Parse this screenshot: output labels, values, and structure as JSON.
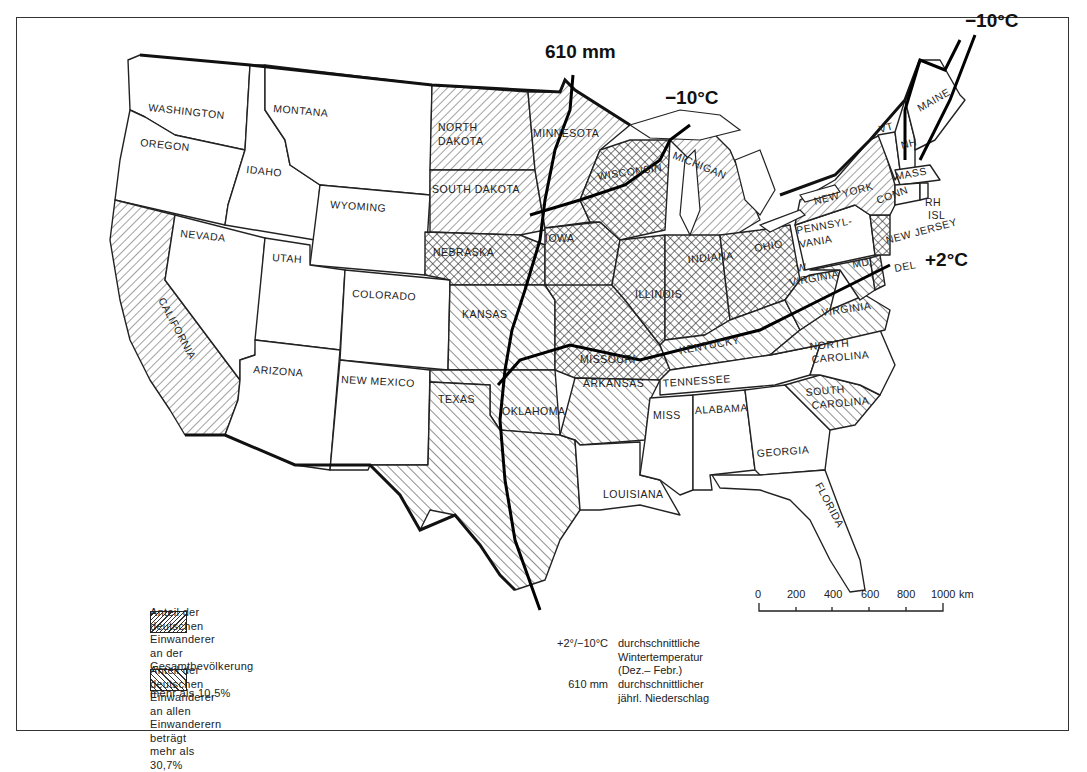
{
  "map": {
    "title": "",
    "subject": "German immigrants in the United States",
    "states": {
      "washington": "WASHINGTON",
      "oregon": "OREGON",
      "california": "CALIFORNIA",
      "nevada": "NEVADA",
      "idaho": "IDAHO",
      "montana": "MONTANA",
      "wyoming": "WYOMING",
      "utah": "UTAH",
      "arizona": "ARIZONA",
      "colorado": "COLORADO",
      "new_mexico": "NEW MEXICO",
      "north_dakota_1": "NORTH",
      "north_dakota_2": "DAKOTA",
      "south_dakota": "SOUTH DAKOTA",
      "nebraska": "NEBRASKA",
      "kansas": "KANSAS",
      "oklahoma": "OKLAHOMA",
      "texas": "TEXAS",
      "minnesota": "MINNESOTA",
      "iowa": "IOWA",
      "missouri": "MISSOURI",
      "arkansas": "ARKANSAS",
      "louisiana": "LOUISIANA",
      "wisconsin": "WISCONSIN",
      "illinois": "ILLINOIS",
      "michigan": "MICHIGAN",
      "indiana": "INDIANA",
      "ohio": "OHIO",
      "kentucky": "KENTUCKY",
      "tennessee": "TENNESSEE",
      "mississippi": "MISS",
      "alabama": "ALABAMA",
      "georgia": "GEORGIA",
      "florida": "FLORIDA",
      "south_carolina_1": "SOUTH",
      "south_carolina_2": "CAROLINA",
      "north_carolina_1": "NORTH",
      "north_carolina_2": "CAROLINA",
      "virginia": "VIRGINIA",
      "west_virginia_1": "W.",
      "west_virginia_2": "VIRGINIA",
      "pennsylvania_1": "PENNSYL-",
      "pennsylvania_2": "VANIA",
      "new_york": "NEW YORK",
      "new_jersey": "NEW JERSEY",
      "delaware": "DEL",
      "maryland": "MD",
      "connecticut": "CONN",
      "rhode_island_1": "RH",
      "rhode_island_2": "ISL",
      "massachusetts": "MASS",
      "vermont": "VT",
      "new_hampshire": "NH",
      "maine": "MAINE"
    },
    "shading": {
      "share_of_total_population_gt_10_5": [
        "NORTH DAKOTA",
        "SOUTH DAKOTA",
        "MINNESOTA",
        "MICHIGAN",
        "NEW YORK",
        "CALIFORNIA"
      ],
      "share_of_all_immigrants_gt_30_7": [
        "KANSAS",
        "OKLAHOMA",
        "TEXAS",
        "ARKANSAS",
        "MISSOURI",
        "KENTUCKY",
        "WEST VIRGINIA",
        "VIRGINIA",
        "MARYLAND",
        "SOUTH CAROLINA"
      ],
      "both": [
        "NEBRASKA",
        "IOWA",
        "WISCONSIN",
        "ILLINOIS",
        "INDIANA",
        "OHIO",
        "NEW JERSEY",
        "DELAWARE"
      ]
    },
    "isolines": {
      "precip_610": "610 mm",
      "temp_minus10_north": "−10°C",
      "temp_minus10_lakes": "−10°C",
      "temp_plus2": "+2°C"
    }
  },
  "legend": {
    "item_a": {
      "line1": "Anteil der deutschen Einwanderer",
      "line2": "an der Gesamtbevölkerung beträgt",
      "line3": "mehr als 10,5%"
    },
    "item_b": {
      "line1": "Anteil der deutschen Einwanderer",
      "line2": "an allen Einwanderern beträgt",
      "line3": "mehr als 30,7%"
    },
    "temperature": {
      "key": "+2°/−10°C",
      "line1": "durchschnittliche",
      "line2": "Wintertemperatur",
      "line3": "(Dez.– Febr.)"
    },
    "precipitation": {
      "key": "610 mm",
      "line1": "durchschnittlicher",
      "line2": "jährl. Niederschlag"
    }
  },
  "scale_bar": {
    "ticks": [
      "0",
      "200",
      "400",
      "600",
      "800",
      "1000"
    ],
    "unit": "km"
  }
}
